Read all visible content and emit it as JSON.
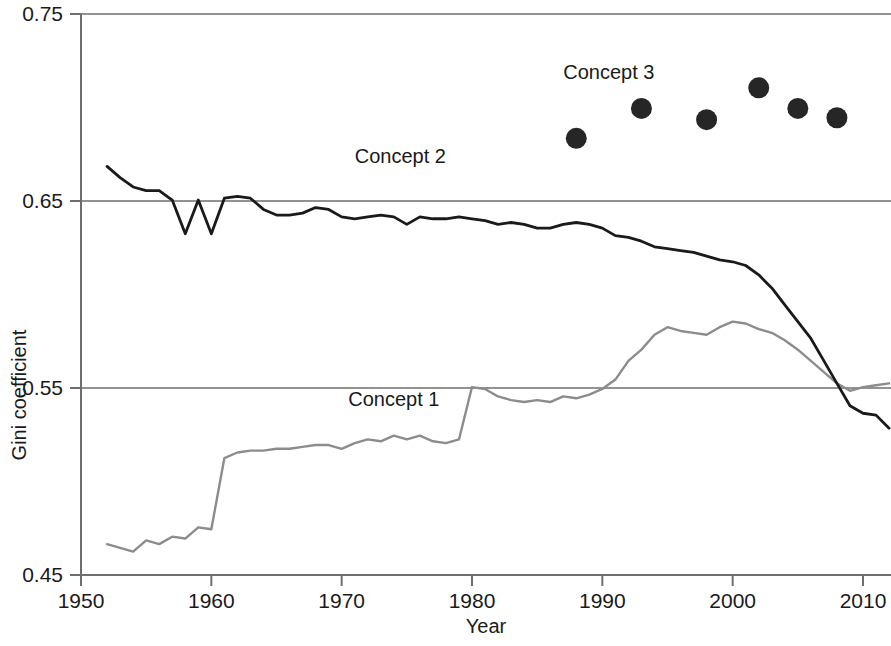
{
  "chart_data": {
    "type": "line",
    "title": "",
    "xlabel": "Year",
    "ylabel": "Gini coefficient",
    "xlim": [
      1950,
      2012
    ],
    "ylim": [
      0.45,
      0.75
    ],
    "xticks": [
      1950,
      1960,
      1970,
      1980,
      1990,
      2000,
      2010
    ],
    "xtick_labels": [
      "1950",
      "1960",
      "1970",
      "1980",
      "1990",
      "2000",
      "2010"
    ],
    "yticks": [
      0.45,
      0.55,
      0.65,
      0.75
    ],
    "ytick_labels": [
      "0.45",
      "0.55",
      "0.65",
      "0.75"
    ],
    "grid": true,
    "gridlines_y": [
      0.55,
      0.65,
      0.75
    ],
    "legend_position": "inline-annotations",
    "series": [
      {
        "name": "Concept 1",
        "label": "Concept 1",
        "type": "line",
        "color": "#8c8c8c",
        "linewidth": 2.4,
        "label_x": 1974.0,
        "label_y": 0.5405,
        "x": [
          1952,
          1953,
          1954,
          1955,
          1956,
          1957,
          1958,
          1959,
          1960,
          1961,
          1962,
          1963,
          1964,
          1965,
          1966,
          1967,
          1968,
          1969,
          1970,
          1971,
          1972,
          1973,
          1974,
          1975,
          1976,
          1977,
          1978,
          1979,
          1980,
          1981,
          1982,
          1983,
          1984,
          1985,
          1986,
          1987,
          1988,
          1989,
          1990,
          1991,
          1992,
          1993,
          1994,
          1995,
          1996,
          1997,
          1998,
          1999,
          2000,
          2001,
          2002,
          2003,
          2004,
          2005,
          2006,
          2007,
          2008,
          2009,
          2010,
          2011,
          2012
        ],
        "y": [
          0.4665,
          0.4645,
          0.4625,
          0.4685,
          0.4665,
          0.4705,
          0.4695,
          0.4755,
          0.4745,
          0.5125,
          0.5155,
          0.5165,
          0.5165,
          0.5175,
          0.5175,
          0.5185,
          0.5195,
          0.5195,
          0.5175,
          0.5205,
          0.5225,
          0.5215,
          0.5245,
          0.5225,
          0.5245,
          0.5215,
          0.5205,
          0.5225,
          0.5505,
          0.5495,
          0.5455,
          0.5435,
          0.5425,
          0.5435,
          0.5425,
          0.5455,
          0.5445,
          0.5465,
          0.5495,
          0.5545,
          0.5645,
          0.5705,
          0.5785,
          0.5825,
          0.5805,
          0.5795,
          0.5785,
          0.5825,
          0.5855,
          0.5845,
          0.5815,
          0.5795,
          0.5755,
          0.5705,
          0.5645,
          0.5585,
          0.5525,
          0.5485,
          0.5505,
          0.5515,
          0.5525
        ]
      },
      {
        "name": "Concept 2",
        "label": "Concept 2",
        "type": "line",
        "color": "#1a1a1a",
        "linewidth": 2.8,
        "label_x": 1974.5,
        "label_y": 0.6705,
        "x": [
          1952,
          1953,
          1954,
          1955,
          1956,
          1957,
          1958,
          1959,
          1960,
          1961,
          1962,
          1963,
          1964,
          1965,
          1966,
          1967,
          1968,
          1969,
          1970,
          1971,
          1972,
          1973,
          1974,
          1975,
          1976,
          1977,
          1978,
          1979,
          1980,
          1981,
          1982,
          1983,
          1984,
          1985,
          1986,
          1987,
          1988,
          1989,
          1990,
          1991,
          1992,
          1993,
          1994,
          1995,
          1996,
          1997,
          1998,
          1999,
          2000,
          2001,
          2002,
          2003,
          2004,
          2005,
          2006,
          2007,
          2008,
          2009,
          2010,
          2011,
          2012
        ],
        "y": [
          0.6685,
          0.6625,
          0.6575,
          0.6555,
          0.6555,
          0.6505,
          0.6325,
          0.6505,
          0.6325,
          0.6515,
          0.6525,
          0.6515,
          0.6455,
          0.6425,
          0.6425,
          0.6435,
          0.6465,
          0.6455,
          0.6415,
          0.6405,
          0.6415,
          0.6425,
          0.6415,
          0.6375,
          0.6415,
          0.6405,
          0.6405,
          0.6415,
          0.6405,
          0.6395,
          0.6375,
          0.6385,
          0.6375,
          0.6355,
          0.6355,
          0.6375,
          0.6385,
          0.6375,
          0.6355,
          0.6315,
          0.6305,
          0.6285,
          0.6255,
          0.6245,
          0.6235,
          0.6225,
          0.6205,
          0.6185,
          0.6175,
          0.6155,
          0.6105,
          0.6035,
          0.5945,
          0.5855,
          0.5765,
          0.5645,
          0.5525,
          0.5405,
          0.5365,
          0.5355,
          0.5285
        ]
      },
      {
        "name": "Concept 3",
        "label": "Concept 3",
        "type": "scatter",
        "color": "#262626",
        "marker": "circle",
        "marker_size": 21,
        "label_x": 1990.5,
        "label_y": 0.7155,
        "x": [
          1988,
          1993,
          1998,
          2002,
          2005,
          2008
        ],
        "y": [
          0.6835,
          0.6995,
          0.6935,
          0.7105,
          0.6995,
          0.6945
        ]
      }
    ]
  },
  "axes": {
    "x_title": "Year",
    "y_title": "Gini coefficient"
  }
}
